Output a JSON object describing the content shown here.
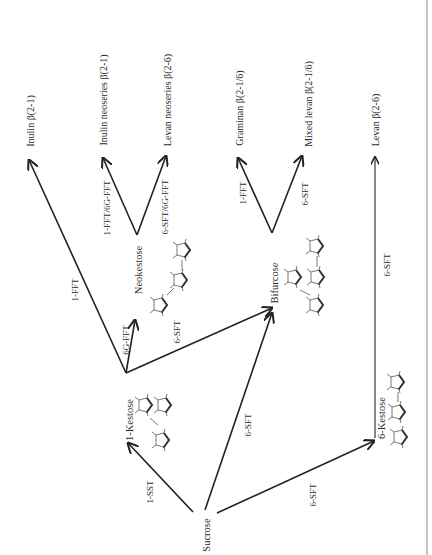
{
  "diagram": {
    "orientation": "rotated 90° counter-clockwise (landscape figure on portrait page)",
    "colors": {
      "line": "#222222",
      "text": "#2a2a2a",
      "border": "#888888",
      "background": "#ffffff"
    },
    "nodes": {
      "sucrose": "Sucrose",
      "kestose_1": "1-Kestose",
      "neokestose": "Neokestose",
      "bifurcose": "Bifurcose",
      "kestose_6": "6-Kestose"
    },
    "products": {
      "inulin": "Inulin β(2-1)",
      "inulin_neoseries": "Inulin neoseries β(2-1)",
      "levan_neoseries": "Levan neoseries β(2-6)",
      "graminan": "Graminan β(2-1/6)",
      "mixed_levan": "Mixed levan β(2-1/6)",
      "levan": "Levan β(2-6)"
    },
    "enzymes": {
      "sucrose_to_1kestose": "1-SST",
      "sucrose_to_bifurcose": "6-SFT",
      "sucrose_to_6kestose": "6-SFT",
      "kestose1_to_inulin": "1-FFT",
      "kestose1_to_neokestose": "6G-FFT",
      "kestose1_to_bifurcose": "6-SFT",
      "neokestose_to_inulin_neo": "1-FFT/6G-FFT",
      "neokestose_to_levan_neo": "6-SFT/6G-FFT",
      "bifurcose_to_graminan": "1-FFT",
      "bifurcose_to_mixed_levan": "6-SFT",
      "kestose6_to_levan": "6-SFT"
    },
    "edges": [
      {
        "from": "Sucrose",
        "to": "1-Kestose",
        "enzyme": "1-SST"
      },
      {
        "from": "Sucrose",
        "to": "Bifurcose",
        "enzyme": "6-SFT"
      },
      {
        "from": "Sucrose",
        "to": "6-Kestose",
        "enzyme": "6-SFT"
      },
      {
        "from": "1-Kestose",
        "to": "Inulin β(2-1)",
        "enzyme": "1-FFT"
      },
      {
        "from": "1-Kestose",
        "to": "Neokestose",
        "enzyme": "6G-FFT"
      },
      {
        "from": "1-Kestose",
        "to": "Bifurcose",
        "enzyme": "6-SFT"
      },
      {
        "from": "Neokestose",
        "to": "Inulin neoseries β(2-1)",
        "enzyme": "1-FFT/6G-FFT"
      },
      {
        "from": "Neokestose",
        "to": "Levan neoseries β(2-6)",
        "enzyme": "6-SFT/6G-FFT"
      },
      {
        "from": "Bifurcose",
        "to": "Graminan β(2-1/6)",
        "enzyme": "1-FFT"
      },
      {
        "from": "Bifurcose",
        "to": "Mixed levan β(2-1/6)",
        "enzyme": "6-SFT"
      },
      {
        "from": "6-Kestose",
        "to": "Levan β(2-6)",
        "enzyme": "6-SFT"
      }
    ]
  }
}
